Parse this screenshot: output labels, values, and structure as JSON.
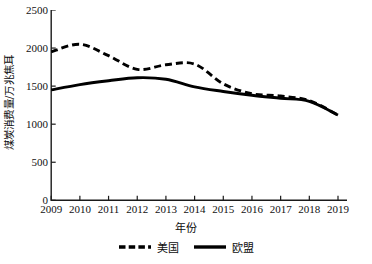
{
  "chart_data": {
    "type": "line",
    "title": "",
    "xlabel": "年份",
    "ylabel": "煤炭消费量/万兆焦耳",
    "x": [
      2009,
      2010,
      2011,
      2012,
      2013,
      2014,
      2015,
      2016,
      2017,
      2018,
      2019
    ],
    "categories": [
      "2009",
      "2010",
      "2011",
      "2012",
      "2013",
      "2014",
      "2015",
      "2016",
      "2017",
      "2018",
      "2019"
    ],
    "xlim": [
      2009,
      2019
    ],
    "ylim": [
      0,
      2500
    ],
    "yticks": [
      0,
      500,
      1000,
      1500,
      2000,
      2500
    ],
    "ytick_labels": [
      "0",
      "500",
      "1000",
      "1500",
      "2000",
      "2500"
    ],
    "grid": false,
    "legend_position": "bottom",
    "series": [
      {
        "name": "美国",
        "style": "dashed",
        "color": "#000000",
        "values": [
          1950,
          2050,
          1900,
          1720,
          1780,
          1790,
          1530,
          1400,
          1370,
          1310,
          1120
        ]
      },
      {
        "name": "欧盟",
        "style": "solid",
        "color": "#000000",
        "values": [
          1450,
          1520,
          1570,
          1610,
          1590,
          1490,
          1430,
          1380,
          1340,
          1300,
          1120
        ]
      }
    ]
  },
  "axis": {
    "y_title": "煤炭消费量/万兆焦耳",
    "x_title": "年份"
  },
  "legend": {
    "items": [
      {
        "label": "美国",
        "style": "dashed"
      },
      {
        "label": "欧盟",
        "style": "solid"
      }
    ]
  },
  "colors": {
    "axis": "#1a1a1a",
    "series_us": "#000000",
    "series_eu": "#000000",
    "background": "#ffffff"
  }
}
